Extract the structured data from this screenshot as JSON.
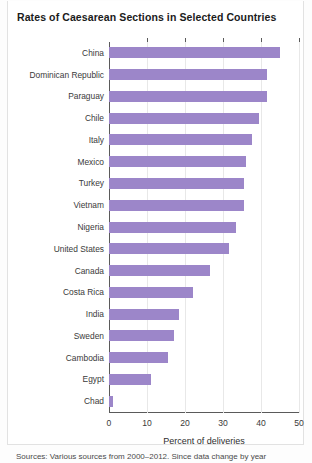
{
  "chart_data": {
    "type": "bar",
    "orientation": "horizontal",
    "title": "Rates of Caesarean Sections in Selected Countries",
    "xlabel": "Percent of deliveries",
    "ylabel": "",
    "xlim": [
      0,
      50
    ],
    "xticks": [
      0,
      10,
      20,
      30,
      40,
      50
    ],
    "grid": true,
    "legend": false,
    "bar_color": "#9c86c9",
    "categories": [
      "China",
      "Dominican Republic",
      "Paraguay",
      "Chile",
      "Italy",
      "Mexico",
      "Turkey",
      "Vietnam",
      "Nigeria",
      "United States",
      "Canada",
      "Costa Rica",
      "India",
      "Sweden",
      "Cambodia",
      "Egypt",
      "Chad"
    ],
    "values": [
      45,
      41.5,
      41.5,
      39.5,
      37.5,
      36,
      35.5,
      35.5,
      33.5,
      31.5,
      26.5,
      22,
      18.5,
      17,
      15.5,
      11,
      1
    ]
  },
  "footnote": {
    "text": "Sources: Various sources from 2000–2012. Since data change by year"
  }
}
